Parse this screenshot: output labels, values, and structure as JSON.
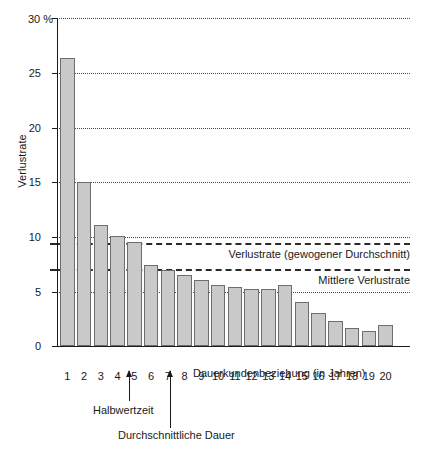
{
  "chart_data": {
    "type": "bar",
    "title": "",
    "xlabel": "Dauerkundenbeziehung (in Jahren)",
    "ylabel": "Verlustrate",
    "unit_label": "30 %",
    "ylim": [
      0,
      30
    ],
    "yticks": [
      0,
      5,
      10,
      15,
      20,
      25,
      30
    ],
    "ytick_labels": [
      "0",
      "5",
      "10",
      "15",
      "20",
      "25",
      "30 %"
    ],
    "grid": true,
    "grid_axis": "y",
    "legend": "none",
    "categories": [
      "1",
      "2",
      "3",
      "4",
      "5",
      "6",
      "7",
      "8",
      "9",
      "10",
      "11",
      "12",
      "13",
      "14",
      "15",
      "16",
      "17",
      "18",
      "19",
      "20"
    ],
    "values": [
      26.3,
      15.0,
      11.0,
      10.0,
      9.5,
      7.4,
      6.9,
      6.5,
      6.0,
      5.6,
      5.4,
      5.2,
      5.2,
      5.6,
      4.0,
      3.0,
      2.3,
      1.6,
      1.4,
      1.9
    ],
    "series_name": "Verlustrate",
    "bar_color": "#c9c9c9",
    "bar_border_color": "#6e6e6e",
    "reference_lines": [
      {
        "id": "weighted-average",
        "label": "Verlustrate (gewogener Durchschnitt)",
        "value": 9.5,
        "style": "dashed"
      },
      {
        "id": "mean-loss-rate",
        "label": "Mittlere Verlustrate",
        "value": 7.1,
        "style": "dashed"
      }
    ],
    "annotations": [
      {
        "id": "half-life",
        "label": "Halbwertzeit",
        "x_value": 4.5
      },
      {
        "id": "average-duration",
        "label": "Durchschnittliche Dauer",
        "x_value": 7.0
      }
    ]
  },
  "colors": {
    "axis": "#1a1a1a",
    "grid": "#4a4a4a",
    "reference": "#2a2a2a",
    "background": "#ffffff"
  }
}
